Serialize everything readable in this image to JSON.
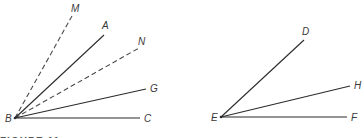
{
  "figure": {
    "caption": "FIGURE 11",
    "left_diagram": {
      "vertex": {
        "label": "B",
        "x": 15,
        "y": 118,
        "lx": 5,
        "ly": 122
      },
      "rays": [
        {
          "label": "M",
          "style": "dashed",
          "x": 72,
          "y": 16,
          "lx": 71,
          "ly": 12
        },
        {
          "label": "A",
          "style": "solid",
          "x": 104,
          "y": 35,
          "lx": 102,
          "ly": 29
        },
        {
          "label": "N",
          "style": "dashed",
          "x": 139,
          "y": 48,
          "lx": 138,
          "ly": 45
        },
        {
          "label": "G",
          "style": "solid",
          "x": 146,
          "y": 89,
          "lx": 150,
          "ly": 92
        },
        {
          "label": "C",
          "style": "solid",
          "x": 140,
          "y": 118,
          "lx": 144,
          "ly": 122
        }
      ]
    },
    "right_diagram": {
      "vertex": {
        "label": "E",
        "x": 221,
        "y": 117,
        "lx": 211,
        "ly": 121
      },
      "rays": [
        {
          "label": "D",
          "style": "solid",
          "x": 304,
          "y": 40,
          "lx": 302,
          "ly": 35
        },
        {
          "label": "H",
          "style": "solid",
          "x": 350,
          "y": 86,
          "lx": 354,
          "ly": 89
        },
        {
          "label": "F",
          "style": "solid",
          "x": 347,
          "y": 117,
          "lx": 351,
          "ly": 121
        }
      ]
    }
  }
}
